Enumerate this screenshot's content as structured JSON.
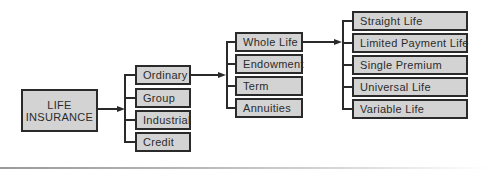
{
  "diagram": {
    "type": "hierarchy",
    "root": {
      "label_line1": "LIFE",
      "label_line2": "INSURANCE"
    },
    "level2": [
      {
        "label": "Ordinary"
      },
      {
        "label": "Group"
      },
      {
        "label": "Industrial"
      },
      {
        "label": "Credit"
      }
    ],
    "level3": [
      {
        "label": "Whole Life"
      },
      {
        "label": "Endowment"
      },
      {
        "label": "Term"
      },
      {
        "label": "Annuities"
      }
    ],
    "level4": [
      {
        "label": "Straight Life"
      },
      {
        "label": "Limited Payment Life"
      },
      {
        "label": "Single Premium"
      },
      {
        "label": "Universal Life"
      },
      {
        "label": "Variable Life"
      }
    ],
    "edges": [
      {
        "from": "LIFE INSURANCE",
        "to": [
          "Ordinary",
          "Group",
          "Industrial",
          "Credit"
        ]
      },
      {
        "from": "Ordinary",
        "to": [
          "Whole Life",
          "Endowment",
          "Term",
          "Annuities"
        ]
      },
      {
        "from": "Whole Life",
        "to": [
          "Straight Life",
          "Limited Payment Life",
          "Single Premium",
          "Universal Life",
          "Variable Life"
        ]
      }
    ],
    "colors": {
      "box_fill": "#d3d3d3",
      "box_border": "#2a2a2a",
      "text": "#2b2b2b",
      "connector": "#2a2a2a"
    }
  }
}
